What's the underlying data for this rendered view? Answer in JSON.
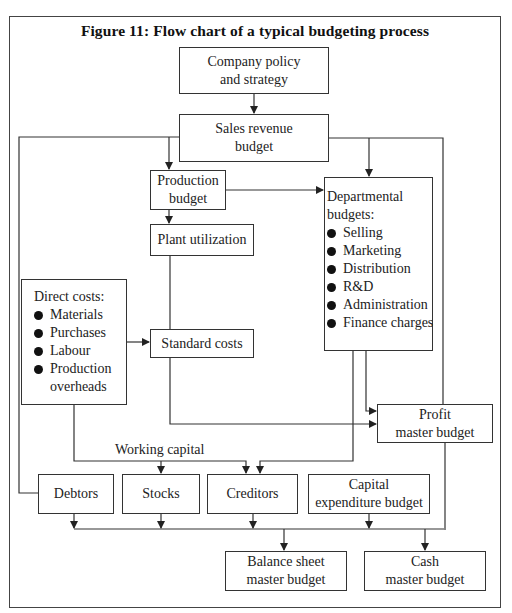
{
  "figure": {
    "title": "Figure 11: Flow chart of a typical budgeting process"
  },
  "nodes": {
    "company_policy": {
      "lines": [
        "Company policy",
        "and strategy"
      ]
    },
    "sales_revenue": {
      "lines": [
        "Sales revenue",
        "budget"
      ]
    },
    "production": {
      "lines": [
        "Production",
        "budget"
      ]
    },
    "plant_utilization": {
      "lines": [
        "Plant utilization"
      ]
    },
    "departmental": {
      "heading": [
        "Departmental",
        "budgets:"
      ],
      "items": [
        "Selling",
        "Marketing",
        "Distribution",
        "R&D",
        "Administration",
        "Finance charges"
      ]
    },
    "direct_costs": {
      "heading": [
        "Direct costs:"
      ],
      "items": [
        "Materials",
        "Purchases",
        "Labour",
        "Production"
      ],
      "continuation": "overheads"
    },
    "standard_costs": {
      "lines": [
        "Standard costs"
      ]
    },
    "profit_master": {
      "lines": [
        "Profit",
        "master budget"
      ]
    },
    "debtors": {
      "lines": [
        "Debtors"
      ]
    },
    "stocks": {
      "lines": [
        "Stocks"
      ]
    },
    "creditors": {
      "lines": [
        "Creditors"
      ]
    },
    "capital_expenditure": {
      "lines": [
        "Capital",
        "expenditure budget"
      ]
    },
    "balance_sheet_master": {
      "lines": [
        "Balance sheet",
        "master budget"
      ]
    },
    "cash_master": {
      "lines": [
        "Cash",
        "master budget"
      ]
    }
  },
  "labels": {
    "working_capital": "Working capital"
  },
  "edges": [
    {
      "from": "Company policy and strategy",
      "to": "Sales revenue budget"
    },
    {
      "from": "Sales revenue budget",
      "to": "Production budget"
    },
    {
      "from": "Sales revenue budget",
      "to": "Departmental budgets"
    },
    {
      "from": "Sales revenue budget",
      "to": "Debtors"
    },
    {
      "from": "Sales revenue budget",
      "to": "Profit master budget"
    },
    {
      "from": "Production budget",
      "to": "Plant utilization"
    },
    {
      "from": "Production budget",
      "to": "Departmental budgets"
    },
    {
      "from": "Plant utilization",
      "to": "Standard costs"
    },
    {
      "from": "Direct costs",
      "to": "Standard costs"
    },
    {
      "from": "Direct costs",
      "to": "Stocks"
    },
    {
      "from": "Direct costs",
      "to": "Creditors"
    },
    {
      "from": "Standard costs",
      "to": "Profit master budget"
    },
    {
      "from": "Departmental budgets",
      "to": "Profit master budget"
    },
    {
      "from": "Departmental budgets",
      "to": "Creditors"
    },
    {
      "from": "Debtors",
      "to": "Balance sheet master budget"
    },
    {
      "from": "Stocks",
      "to": "Balance sheet master budget"
    },
    {
      "from": "Creditors",
      "to": "Balance sheet master budget"
    },
    {
      "from": "Capital expenditure budget",
      "to": "Balance sheet master budget"
    },
    {
      "from": "Profit master budget",
      "to": "Cash master budget"
    }
  ],
  "colors": {
    "line": "#333333",
    "text": "#222222",
    "background": "#ffffff"
  }
}
